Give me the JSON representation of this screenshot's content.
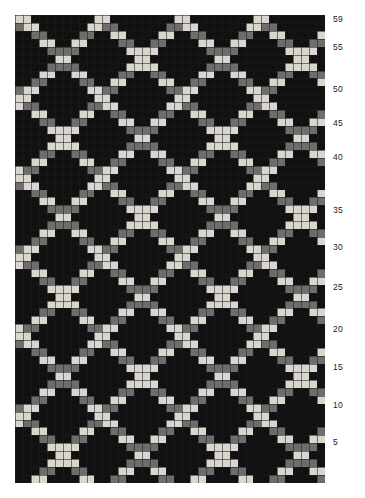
{
  "page": {
    "background_color": "#ffffff"
  },
  "chart_data": {
    "type": "heatmap",
    "title": "",
    "xlabel": "",
    "ylabel": "",
    "grid": {
      "columns": 39,
      "rows": 59,
      "cell_width_px": 7.95,
      "cell_height_px": 7.93,
      "origin_x_px": 15,
      "origin_y_px": 15,
      "width_px": 310,
      "height_px": 468,
      "row_numbering": "bottom-to-top",
      "gridlines": true,
      "gridline_color": "#1d1d1d"
    },
    "palette": {
      "background": "#0b0b0b",
      "dark": "#111111",
      "mid": "#6d6d6d",
      "light": "#d9d6cd"
    },
    "legend": {
      "visible": false,
      "position": "none",
      "entries": [
        {
          "label": "dark",
          "color": "#111111"
        },
        {
          "label": "mid",
          "color": "#6d6d6d"
        },
        {
          "label": "light",
          "color": "#d9d6cd"
        }
      ]
    },
    "pattern": {
      "motif": "diagonal-lattice-diamond",
      "period_x": 10,
      "period_y": 10,
      "stroke_thickness_cells": 2,
      "phase_x": 0,
      "phase_y": 0
    },
    "axis": {
      "side": "right",
      "ylim": [
        1,
        59
      ],
      "tick_values": [
        5,
        10,
        15,
        20,
        25,
        30,
        35,
        40,
        45,
        50,
        55,
        59
      ],
      "tick_labels": [
        "5",
        "10",
        "15",
        "20",
        "25",
        "30",
        "35",
        "40",
        "45",
        "50",
        "55",
        "59"
      ],
      "tick_pixel_y": [
        443,
        406,
        368,
        330,
        288,
        248,
        211,
        158,
        124,
        90,
        48,
        20
      ],
      "label_color": "#1b1b1b",
      "font_size_px": 8.5
    }
  }
}
